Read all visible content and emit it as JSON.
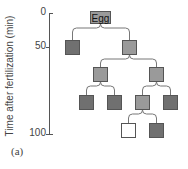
{
  "figure": {
    "panel_label": "(a)",
    "y_axis": {
      "label": "Time after fertilization (min)",
      "ticks": [
        {
          "value": "0",
          "y": 13
        },
        {
          "value": "50",
          "y": 47
        },
        {
          "value": "100",
          "y": 134
        }
      ]
    },
    "colors": {
      "dark": "#707070",
      "medium": "#9a9a9a",
      "white": "#ffffff",
      "line": "#777777"
    },
    "root": {
      "label": "Egg"
    },
    "nodes": [
      {
        "id": "egg",
        "x": 90,
        "y": 11,
        "w": 21,
        "h": 13,
        "fill": "medium",
        "label": "Egg"
      },
      {
        "id": "n1a",
        "x": 65,
        "y": 40,
        "w": 15,
        "h": 15,
        "fill": "dark"
      },
      {
        "id": "n1b",
        "x": 122,
        "y": 40,
        "w": 15,
        "h": 15,
        "fill": "medium"
      },
      {
        "id": "n2a",
        "x": 93,
        "y": 67,
        "w": 15,
        "h": 15,
        "fill": "medium"
      },
      {
        "id": "n2b",
        "x": 149,
        "y": 67,
        "w": 15,
        "h": 15,
        "fill": "medium"
      },
      {
        "id": "n3a",
        "x": 79,
        "y": 95,
        "w": 15,
        "h": 15,
        "fill": "dark"
      },
      {
        "id": "n3b",
        "x": 107,
        "y": 95,
        "w": 15,
        "h": 15,
        "fill": "dark"
      },
      {
        "id": "n3c",
        "x": 135,
        "y": 95,
        "w": 15,
        "h": 15,
        "fill": "medium"
      },
      {
        "id": "n3d",
        "x": 163,
        "y": 95,
        "w": 15,
        "h": 15,
        "fill": "dark"
      },
      {
        "id": "n4a",
        "x": 121,
        "y": 123,
        "w": 15,
        "h": 15,
        "fill": "white"
      },
      {
        "id": "n4b",
        "x": 149,
        "y": 123,
        "w": 15,
        "h": 15,
        "fill": "dark"
      }
    ],
    "edges": [
      [
        "egg",
        "n1a"
      ],
      [
        "egg",
        "n1b"
      ],
      [
        "n1b",
        "n2a"
      ],
      [
        "n1b",
        "n2b"
      ],
      [
        "n2a",
        "n3a"
      ],
      [
        "n2a",
        "n3b"
      ],
      [
        "n2b",
        "n3c"
      ],
      [
        "n2b",
        "n3d"
      ],
      [
        "n3c",
        "n4a"
      ],
      [
        "n3c",
        "n4b"
      ]
    ]
  }
}
